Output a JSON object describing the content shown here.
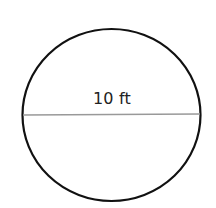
{
  "diagram": {
    "shape": "circle",
    "measurement": "diameter",
    "label": "10 ft",
    "colors": {
      "outline": "#111111",
      "diameter_line": "#999999",
      "text": "#222222",
      "background": "#ffffff"
    }
  }
}
